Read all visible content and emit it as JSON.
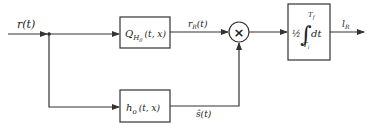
{
  "diagram": {
    "input": {
      "label": "r(t)"
    },
    "top_block": {
      "name": "Q",
      "subscript": "H",
      "subsub": "0",
      "args": "(t, x)"
    },
    "bottom_block": {
      "name": "h",
      "subscript": "o",
      "args": "(t, x)"
    },
    "top_signal": {
      "label": "r",
      "subscript": "R",
      "args": "(t)"
    },
    "bottom_signal": {
      "label": "ŝ(t)"
    },
    "multiplier": {
      "symbol": "×"
    },
    "integrator": {
      "prefix": "½",
      "integral": "∫",
      "upper": "T",
      "upper_sub": "f",
      "lower": "T",
      "lower_sub": "i",
      "suffix": "dt"
    },
    "output": {
      "label": "l",
      "subscript": "R"
    }
  }
}
